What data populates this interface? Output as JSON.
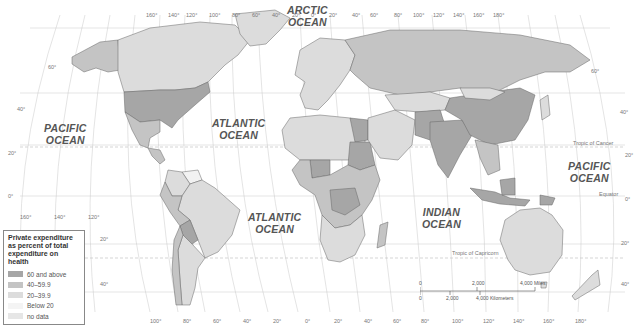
{
  "map": {
    "title": "Private expenditure as percent of total expenditure on health",
    "oceans": [
      {
        "id": "arctic",
        "lines": [
          "ARCTIC",
          "OCEAN"
        ],
        "x": 287,
        "y": 4
      },
      {
        "id": "atlantic-north",
        "lines": [
          "ATLANTIC",
          "OCEAN"
        ],
        "x": 212,
        "y": 117
      },
      {
        "id": "pacific-west",
        "lines": [
          "PACIFIC",
          "OCEAN"
        ],
        "x": 44,
        "y": 122
      },
      {
        "id": "atlantic-south",
        "lines": [
          "ATLANTIC",
          "OCEAN"
        ],
        "x": 248,
        "y": 211
      },
      {
        "id": "indian",
        "lines": [
          "INDIAN",
          "OCEAN"
        ],
        "x": 422,
        "y": 206
      },
      {
        "id": "pacific-east",
        "lines": [
          "PACIFIC",
          "OCEAN"
        ],
        "x": 568,
        "y": 160
      }
    ],
    "top_longitudes": [
      "160°",
      "140°",
      "120°",
      "100°",
      "80°",
      "60°",
      "40°",
      "20°",
      "0°",
      "20°",
      "40°",
      "60°",
      "80°",
      "100°",
      "120°",
      "140°",
      "160°",
      "180°"
    ],
    "bottom_longitudes": [
      "160°",
      "140°",
      "120°",
      "100°",
      "80°",
      "60°",
      "40°",
      "20°",
      "0°",
      "20°",
      "40°",
      "60°",
      "80°",
      "100°",
      "120°",
      "140°",
      "160°",
      "180°"
    ],
    "left_latitudes": [
      "60°",
      "40°",
      "20°",
      "0°",
      "20°",
      "40°"
    ],
    "right_latitudes": [
      "60°",
      "40°",
      "20°",
      "0°",
      "20°",
      "40°"
    ],
    "special_lines": {
      "tropic_cancer": "Tropic of Cancer",
      "equator": "Equator",
      "tropic_capricorn": "Tropic of Capricorn"
    },
    "scale": {
      "miles_labels": [
        "0",
        "2,000",
        "4,000 Miles"
      ],
      "km_labels": [
        "0",
        "2,000",
        "4,000 Kilometers"
      ]
    }
  },
  "legend": {
    "title": "Private expenditure as percent of total expenditure on health",
    "items": [
      {
        "label": "60 and above",
        "color": "#a6a6a6"
      },
      {
        "label": "40–59.9",
        "color": "#c4c4c4"
      },
      {
        "label": "20–39.9",
        "color": "#dcdcdc"
      },
      {
        "label": "Below 20",
        "color": "#f4f4f4"
      },
      {
        "label": "no data",
        "color": "#e6e6e6"
      }
    ]
  },
  "colors": {
    "dark": "#a6a6a6",
    "mid": "#c4c4c4",
    "light": "#dcdcdc",
    "lightest": "#f2f2f2",
    "border": "#666666",
    "grid": "#bbbbbb"
  }
}
